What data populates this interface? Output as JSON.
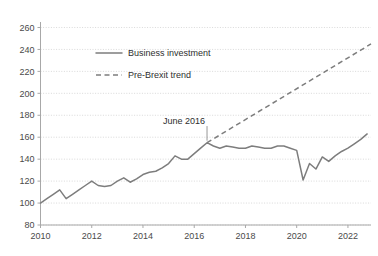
{
  "chart_data": {
    "type": "line",
    "title": "",
    "subtitle": "",
    "xlabel": "",
    "ylabel": "",
    "xlim": [
      2010.0,
      2022.9
    ],
    "ylim": [
      80,
      265
    ],
    "grid": true,
    "grid_axis": "y",
    "legend_position": "top-center",
    "y_ticks": [
      80,
      100,
      120,
      140,
      160,
      180,
      200,
      220,
      240,
      260
    ],
    "y_tick_labels": [
      "80",
      "100",
      "120",
      "140",
      "160",
      "180",
      "200",
      "220",
      "240",
      "260"
    ],
    "x_ticks": [
      2010,
      2012,
      2014,
      2016,
      2018,
      2020,
      2022
    ],
    "x_tick_labels": [
      "2010",
      "2012",
      "2014",
      "2016",
      "2018",
      "2020",
      "2022"
    ],
    "colors": {
      "series_line": "#7d7d7d",
      "trend_line": "#7d7d7d",
      "grid": "#c9c9c9",
      "axis": "#a8a8a8",
      "text": "#2e2e2e",
      "background": "#ffffff"
    },
    "annotations": [
      {
        "text": "June 2016",
        "x": 2016.5,
        "y": 155,
        "label_x": 2015.6,
        "label_y": 172
      }
    ],
    "series": [
      {
        "name": "Business investment",
        "style": "solid",
        "color": "#7d7d7d",
        "x": [
          2010.0,
          2010.25,
          2010.5,
          2010.75,
          2011.0,
          2011.25,
          2011.5,
          2011.75,
          2012.0,
          2012.25,
          2012.5,
          2012.75,
          2013.0,
          2013.25,
          2013.5,
          2013.75,
          2014.0,
          2014.25,
          2014.5,
          2014.75,
          2015.0,
          2015.25,
          2015.5,
          2015.75,
          2016.0,
          2016.25,
          2016.5,
          2016.75,
          2017.0,
          2017.25,
          2017.5,
          2017.75,
          2018.0,
          2018.25,
          2018.5,
          2018.75,
          2019.0,
          2019.25,
          2019.5,
          2019.75,
          2020.0,
          2020.25,
          2020.5,
          2020.75,
          2021.0,
          2021.25,
          2021.5,
          2021.75,
          2022.0,
          2022.25,
          2022.5,
          2022.75
        ],
        "values": [
          100,
          104,
          108,
          112,
          104,
          108,
          112,
          116,
          120,
          116,
          115,
          116,
          120,
          123,
          119,
          122,
          126,
          128,
          129,
          132,
          136,
          143,
          140,
          140,
          145,
          150,
          155,
          152,
          150,
          152,
          151,
          150,
          150,
          152,
          151,
          150,
          150,
          152,
          152,
          150,
          148,
          121,
          136,
          131,
          142,
          138,
          143,
          147,
          150,
          154,
          158,
          163
        ]
      },
      {
        "name": "Pre-Brexit trend",
        "style": "dashed",
        "color": "#7d7d7d",
        "x": [
          2016.5,
          2022.9
        ],
        "values": [
          155,
          245
        ]
      }
    ]
  },
  "legend": {
    "items": [
      {
        "label": "Business investment",
        "style": "solid"
      },
      {
        "label": "Pre-Brexit trend",
        "style": "dashed"
      }
    ]
  }
}
